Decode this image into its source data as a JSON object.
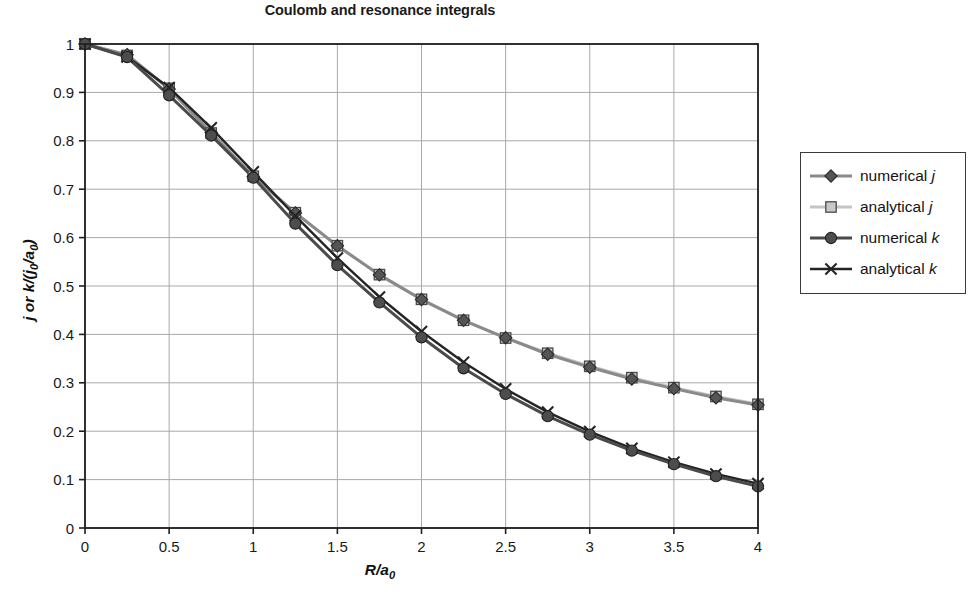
{
  "chart_data": {
    "type": "line",
    "title": "Coulomb and resonance integrals",
    "xlabel": "R/a0",
    "ylabel": "j or k/(j0/a0)",
    "xlim": [
      0,
      4
    ],
    "ylim": [
      0,
      1
    ],
    "xticks": [
      "0",
      "0.5",
      "1",
      "1.5",
      "2",
      "2.5",
      "3",
      "3.5",
      "4"
    ],
    "xtick_values": [
      0,
      0.5,
      1,
      1.5,
      2,
      2.5,
      3,
      3.5,
      4
    ],
    "yticks": [
      "0",
      "0.1",
      "0.2",
      "0.3",
      "0.4",
      "0.5",
      "0.6",
      "0.7",
      "0.8",
      "0.9",
      "1"
    ],
    "ytick_values": [
      0,
      0.1,
      0.2,
      0.3,
      0.4,
      0.5,
      0.6,
      0.7,
      0.8,
      0.9,
      1
    ],
    "grid": true,
    "legend_position": "right-outside",
    "x": [
      0,
      0.25,
      0.5,
      0.75,
      1,
      1.25,
      1.5,
      1.75,
      2,
      2.25,
      2.5,
      2.75,
      3,
      3.25,
      3.5,
      3.75,
      4
    ],
    "series": [
      {
        "name": "numerical j",
        "marker": "diamond",
        "color": "#8a8a8a",
        "marker_color": "#555555",
        "values": [
          1.0,
          0.978,
          0.907,
          0.817,
          0.726,
          0.651,
          0.583,
          0.523,
          0.472,
          0.429,
          0.393,
          0.359,
          0.332,
          0.308,
          0.288,
          0.269,
          0.254
        ]
      },
      {
        "name": "analytical j",
        "marker": "square",
        "color": "#c4c4c4",
        "marker_color": "#c9c9c9",
        "values": [
          1.0,
          0.9763,
          0.9084,
          0.816,
          0.7268,
          0.6514,
          0.5832,
          0.5235,
          0.4725,
          0.4292,
          0.3925,
          0.3611,
          0.3341,
          0.3106,
          0.29,
          0.2718,
          0.2556
        ]
      },
      {
        "name": "numerical k",
        "marker": "circle",
        "color": "#4a4a4a",
        "marker_color": "#4d4d4d",
        "values": [
          1.0,
          0.973,
          0.894,
          0.811,
          0.724,
          0.629,
          0.543,
          0.466,
          0.394,
          0.33,
          0.277,
          0.231,
          0.193,
          0.16,
          0.132,
          0.107,
          0.086
        ]
      },
      {
        "name": "analytical k",
        "marker": "cross",
        "color": "#242424",
        "marker_color": "#242424",
        "values": [
          1.0,
          0.9735,
          0.9098,
          0.8266,
          0.7358,
          0.6447,
          0.5578,
          0.4773,
          0.406,
          0.3425,
          0.2873,
          0.2394,
          0.1991,
          0.1645,
          0.1359,
          0.1116,
          0.0916
        ]
      }
    ],
    "legend": [
      {
        "label_prefix": "numerical",
        "label_symbol": "j",
        "marker": "diamond"
      },
      {
        "label_prefix": "analytical",
        "label_symbol": "j",
        "marker": "square"
      },
      {
        "label_prefix": "numerical",
        "label_symbol": "k",
        "marker": "circle"
      },
      {
        "label_prefix": "analytical",
        "label_symbol": "k",
        "marker": "cross"
      }
    ]
  },
  "colors": {
    "axis": "#1f1f1f",
    "grid": "#a9a9a9",
    "background": "#ffffff",
    "legend_border": "#3a3a3a"
  }
}
